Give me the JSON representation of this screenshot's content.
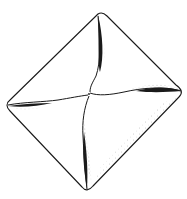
{
  "figure": {
    "description": "Stippled pen-and-ink line drawing of a quadrangular grain with four furrows meeting at the center",
    "colors": {
      "ink": "#1a1a1a",
      "background": "#ffffff",
      "stipple": "#555555"
    },
    "outline_vertices": {
      "top": [
        100,
        14
      ],
      "right": [
        182,
        92
      ],
      "bottom": [
        87,
        190
      ],
      "left": [
        7,
        106
      ]
    },
    "center": [
      88,
      95
    ]
  }
}
